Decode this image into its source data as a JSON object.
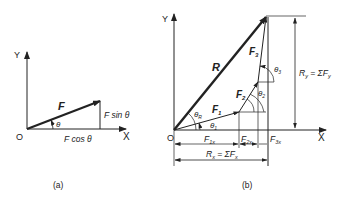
{
  "figure_a": {
    "caption": "(a)",
    "axis_y": "Y",
    "axis_x": "X",
    "origin": "O",
    "vector": "F",
    "angle": "θ",
    "vertical_component": "F sin θ",
    "horizontal_component": "F cos θ"
  },
  "figure_b": {
    "caption": "(b)",
    "axis_y": "Y",
    "axis_x": "X",
    "origin": "O",
    "resultant": "R",
    "forces": [
      "F",
      "F",
      "F"
    ],
    "force_subscripts": [
      "1",
      "2",
      "3"
    ],
    "angles": [
      "θ",
      "θ",
      "θ",
      "θ"
    ],
    "angle_subscripts": [
      "R",
      "1",
      "2",
      "3"
    ],
    "x_components": [
      "F",
      "F",
      "F"
    ],
    "x_component_subscripts": [
      "1x",
      "2x",
      "3x"
    ],
    "rx_label": "R",
    "rx_sub": "x",
    "rx_eq": " = ΣF",
    "rx_eq_sub": "x",
    "ry_label": "R",
    "ry_sub": "y",
    "ry_eq": " = ΣF",
    "ry_eq_sub": "y"
  },
  "colors": {
    "line": "#222222",
    "background": "#ffffff"
  }
}
